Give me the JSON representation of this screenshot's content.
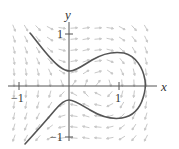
{
  "figure": {
    "type": "direction-field-with-solution-curve",
    "axes": {
      "x_label": "x",
      "y_label": "y",
      "x_ticks": [
        {
          "value": -1,
          "label": "−1"
        },
        {
          "value": 1,
          "label": "1"
        }
      ],
      "y_ticks": [
        {
          "value": 1,
          "label": "1"
        },
        {
          "value": -1,
          "label": "−1"
        }
      ],
      "xlim": [
        -1.1,
        1.6
      ],
      "ylim": [
        -1.15,
        1.3
      ]
    },
    "colors": {
      "axis": "#555555",
      "curve": "#555555",
      "arrows": "#c8c8c8",
      "background": "#ffffff"
    },
    "solution_curve": {
      "description": "Curve with closed loop to the right crossing x-axis near x≈1.5 and two open branches extending to the left",
      "x_axis_crossing": 1.52,
      "y_axis_crossings": [
        0.3,
        -0.28
      ]
    }
  }
}
